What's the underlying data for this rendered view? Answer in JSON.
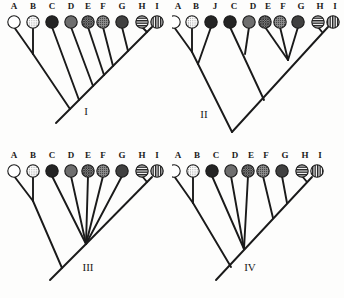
{
  "figure": {
    "type": "phylogenetic-tree-figure",
    "background_color": "#fdfdfc",
    "line_color": "#1a1a1a",
    "panel_count": 4
  },
  "palette": {
    "white": "#ffffff",
    "dotted": "#f2f2f2",
    "black": "#242424",
    "gray": "#6e6e6e",
    "crosshatch": "#555555",
    "stipple": "#7a7a7a",
    "dark_gray": "#404040",
    "horizontal_stripe": "#2b2b2b",
    "vertical_stripe": "#2b2b2b",
    "outline": "#1a1a1a"
  },
  "panels": [
    {
      "id": "panel-I",
      "roman": "I",
      "roman_x": 86,
      "roman_y": 113,
      "tips": [
        {
          "label": "A",
          "x": 14,
          "fill": "white"
        },
        {
          "label": "B",
          "x": 33,
          "fill": "dotted"
        },
        {
          "label": "C",
          "x": 52,
          "fill": "black"
        },
        {
          "label": "D",
          "x": 71,
          "fill": "gray"
        },
        {
          "label": "E",
          "x": 88,
          "fill": "crosshatch"
        },
        {
          "label": "F",
          "x": 103,
          "fill": "stipple"
        },
        {
          "label": "G",
          "x": 122,
          "fill": "dark_gray"
        },
        {
          "label": "H",
          "x": 142,
          "fill": "horizontal_stripe"
        },
        {
          "label": "I",
          "x": 157,
          "fill": "vertical_stripe"
        }
      ]
    },
    {
      "id": "panel-II",
      "roman": "II",
      "roman_x": 32,
      "roman_y": 116,
      "tips": [
        {
          "label": "A",
          "x": 2,
          "fill": "white"
        },
        {
          "label": "B",
          "x": 20,
          "fill": "dotted"
        },
        {
          "label": "J",
          "x": 39,
          "fill": "black"
        },
        {
          "label": "C",
          "x": 58,
          "fill": "black"
        },
        {
          "label": "D",
          "x": 77,
          "fill": "gray"
        },
        {
          "label": "E",
          "x": 93,
          "fill": "crosshatch"
        },
        {
          "label": "F",
          "x": 108,
          "fill": "stipple"
        },
        {
          "label": "G",
          "x": 126,
          "fill": "dark_gray"
        },
        {
          "label": "H",
          "x": 146,
          "fill": "horizontal_stripe"
        },
        {
          "label": "I",
          "x": 161,
          "fill": "vertical_stripe"
        }
      ]
    },
    {
      "id": "panel-III",
      "roman": "III",
      "roman_x": 88,
      "roman_y": 120,
      "tips": [
        {
          "label": "A",
          "x": 14,
          "fill": "white"
        },
        {
          "label": "B",
          "x": 33,
          "fill": "dotted"
        },
        {
          "label": "C",
          "x": 52,
          "fill": "black"
        },
        {
          "label": "D",
          "x": 71,
          "fill": "gray"
        },
        {
          "label": "E",
          "x": 88,
          "fill": "crosshatch"
        },
        {
          "label": "F",
          "x": 103,
          "fill": "stipple"
        },
        {
          "label": "G",
          "x": 122,
          "fill": "dark_gray"
        },
        {
          "label": "H",
          "x": 142,
          "fill": "horizontal_stripe"
        },
        {
          "label": "I",
          "x": 157,
          "fill": "vertical_stripe"
        }
      ]
    },
    {
      "id": "panel-IV",
      "roman": "IV",
      "roman_x": 78,
      "roman_y": 120,
      "tips": [
        {
          "label": "A",
          "x": 2,
          "fill": "white"
        },
        {
          "label": "B",
          "x": 21,
          "fill": "dotted"
        },
        {
          "label": "C",
          "x": 40,
          "fill": "black"
        },
        {
          "label": "D",
          "x": 59,
          "fill": "gray"
        },
        {
          "label": "E",
          "x": 76,
          "fill": "crosshatch"
        },
        {
          "label": "F",
          "x": 91,
          "fill": "stipple"
        },
        {
          "label": "G",
          "x": 110,
          "fill": "dark_gray"
        },
        {
          "label": "H",
          "x": 130,
          "fill": "horizontal_stripe"
        },
        {
          "label": "I",
          "x": 145,
          "fill": "vertical_stripe"
        }
      ]
    }
  ]
}
